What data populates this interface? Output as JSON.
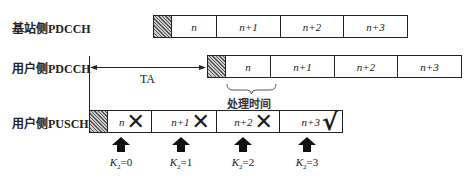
{
  "rows": [
    {
      "label": "基站侧PDCCH",
      "slots": [
        "n",
        "n+1",
        "n+2",
        "n+3"
      ]
    },
    {
      "label": "用户侧PDCCH",
      "slots": [
        "n",
        "n+1",
        "n+2",
        "n+3"
      ]
    },
    {
      "label": "用户侧PUSCH",
      "slots": [
        {
          "text": "n",
          "mark": "✕",
          "status": "invalid"
        },
        {
          "text": "n+1",
          "mark": "✕",
          "status": "invalid"
        },
        {
          "text": "n+2",
          "mark": "✕",
          "status": "invalid"
        },
        {
          "text": "n+3",
          "mark": "√",
          "status": "valid"
        }
      ]
    }
  ],
  "annotations": {
    "timing_advance": "TA",
    "processing_time": "处理时间"
  },
  "k2_labels": [
    {
      "symbol": "K",
      "sub": "2",
      "value": "=0"
    },
    {
      "symbol": "K",
      "sub": "2",
      "value": "=1"
    },
    {
      "symbol": "K",
      "sub": "2",
      "value": "=2"
    },
    {
      "symbol": "K",
      "sub": "2",
      "value": "=3"
    }
  ],
  "colors": {
    "line": "#222222",
    "hatch": "#555555",
    "background": "#ffffff"
  }
}
